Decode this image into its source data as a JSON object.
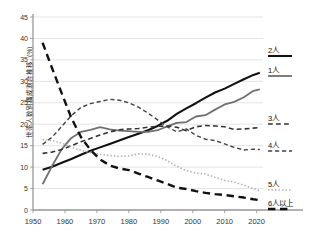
{
  "chart_data": {
    "type": "line",
    "title": "",
    "xlabel": "",
    "ylabel": "世帯人数別構成割合推移（%）",
    "xlim": [
      1950,
      2022
    ],
    "ylim": [
      0,
      45
    ],
    "ytick_step": 5,
    "xtick_step": 10,
    "grid": true,
    "legend_position": "right",
    "xticks": [
      "1950",
      "1960",
      "1970",
      "1980",
      "1990",
      "2000",
      "2010",
      "2020"
    ],
    "yticks": [
      "0",
      "5",
      "10",
      "15",
      "20",
      "25",
      "30",
      "35",
      "40",
      "45"
    ],
    "series": [
      {
        "name": "2人",
        "label": "2人",
        "color": "#111111",
        "style": "solid",
        "width": 2.1,
        "x": [
          1953,
          1956,
          1959,
          1962,
          1965,
          1968,
          1971,
          1974,
          1977,
          1980,
          1983,
          1986,
          1989,
          1992,
          1995,
          1998,
          2001,
          2004,
          2007,
          2010,
          2013,
          2016,
          2019,
          2021
        ],
        "values": [
          9.4,
          10.1,
          11.0,
          11.9,
          12.9,
          13.8,
          14.6,
          15.4,
          16.2,
          17.0,
          17.8,
          18.6,
          19.6,
          20.8,
          22.4,
          23.7,
          24.9,
          26.2,
          27.4,
          28.3,
          29.4,
          30.5,
          31.5,
          32.0
        ]
      },
      {
        "name": "1人",
        "label": "1人",
        "color": "#707070",
        "style": "solid",
        "width": 1.8,
        "x": [
          1953,
          1956,
          1959,
          1962,
          1965,
          1968,
          1971,
          1974,
          1977,
          1980,
          1983,
          1986,
          1989,
          1992,
          1995,
          1998,
          2001,
          2004,
          2007,
          2010,
          2013,
          2016,
          2019,
          2021
        ],
        "values": [
          6.0,
          10.3,
          14.2,
          16.8,
          18.2,
          18.7,
          19.3,
          18.8,
          18.5,
          18.4,
          18.2,
          18.2,
          18.6,
          19.5,
          20.3,
          20.5,
          21.8,
          22.1,
          23.4,
          24.6,
          25.2,
          26.3,
          27.8,
          28.1
        ]
      },
      {
        "name": "3人",
        "label": "3人",
        "color": "#333333",
        "style": "dashed",
        "width": 1.6,
        "x": [
          1953,
          1956,
          1959,
          1962,
          1965,
          1968,
          1971,
          1974,
          1977,
          1980,
          1983,
          1986,
          1989,
          1992,
          1995,
          1998,
          2001,
          2004,
          2007,
          2010,
          2013,
          2016,
          2019,
          2021
        ],
        "values": [
          13.2,
          13.5,
          14.1,
          15.0,
          15.9,
          16.7,
          17.5,
          18.2,
          18.7,
          18.9,
          19.0,
          19.3,
          19.5,
          19.6,
          19.3,
          18.5,
          19.4,
          19.7,
          19.6,
          19.4,
          18.8,
          18.9,
          19.1,
          19.2
        ]
      },
      {
        "name": "4人",
        "label": "4人",
        "color": "#444444",
        "style": "dashed",
        "width": 1.4,
        "x": [
          1953,
          1956,
          1959,
          1962,
          1965,
          1968,
          1971,
          1974,
          1977,
          1980,
          1983,
          1986,
          1989,
          1992,
          1995,
          1998,
          2001,
          2004,
          2007,
          2010,
          2013,
          2016,
          2019,
          2021
        ],
        "values": [
          15.3,
          17.0,
          19.5,
          22.0,
          23.9,
          24.8,
          25.3,
          25.8,
          25.6,
          25.0,
          24.0,
          22.6,
          21.0,
          19.4,
          18.2,
          18.9,
          17.4,
          16.5,
          16.2,
          15.4,
          14.6,
          14.0,
          14.2,
          14.1
        ]
      },
      {
        "name": "5人",
        "label": "5人",
        "color": "#b0b0b0",
        "style": "dotted",
        "width": 1.6,
        "x": [
          1953,
          1956,
          1959,
          1962,
          1965,
          1968,
          1971,
          1974,
          1977,
          1980,
          1983,
          1986,
          1989,
          1992,
          1995,
          1998,
          2001,
          2004,
          2007,
          2010,
          2013,
          2016,
          2019,
          2021
        ],
        "values": [
          16.4,
          16.2,
          15.6,
          14.7,
          13.9,
          13.4,
          13.0,
          12.7,
          12.5,
          12.6,
          13.1,
          13.0,
          12.5,
          11.5,
          10.2,
          9.2,
          8.6,
          8.4,
          7.6,
          6.9,
          6.5,
          5.8,
          5.0,
          4.5
        ]
      },
      {
        "name": "6人以上",
        "label": "6人以上",
        "color": "#111111",
        "style": "longdash",
        "width": 2.4,
        "x": [
          1953,
          1956,
          1959,
          1962,
          1965,
          1968,
          1971,
          1974,
          1977,
          1980,
          1983,
          1986,
          1989,
          1992,
          1995,
          1998,
          2001,
          2004,
          2007,
          2010,
          2013,
          2016,
          2019,
          2021
        ],
        "values": [
          39.0,
          33.0,
          27.2,
          21.5,
          17.0,
          14.0,
          11.8,
          10.4,
          9.7,
          9.3,
          8.5,
          7.7,
          6.9,
          6.1,
          5.2,
          4.9,
          4.4,
          4.0,
          3.7,
          3.5,
          3.2,
          2.9,
          2.5,
          2.3
        ]
      }
    ],
    "legend": [
      {
        "label": "2人",
        "color": "#111111",
        "style": "solid",
        "y": 56
      },
      {
        "label": "1人",
        "color": "#707070",
        "style": "solid",
        "y": 76
      },
      {
        "label": "3人",
        "color": "#333333",
        "style": "dashed",
        "y": 124
      },
      {
        "label": "4人",
        "color": "#444444",
        "style": "dashed",
        "y": 151
      },
      {
        "label": "5人",
        "color": "#b0b0b0",
        "style": "dotted",
        "y": 190
      },
      {
        "label": "6人以上",
        "color": "#111111",
        "style": "longdash",
        "y": 209
      }
    ],
    "axis_color": "#999999",
    "grid_color": "#d8d8d8"
  }
}
